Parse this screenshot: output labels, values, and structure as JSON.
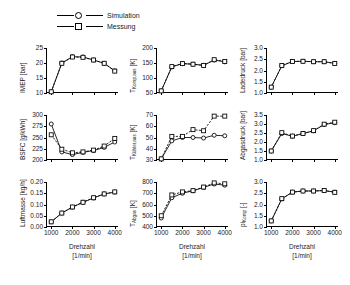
{
  "legend": {
    "entries": [
      {
        "label": "Simulation",
        "marker": "circle-marker-icon"
      },
      {
        "label": "Messung",
        "marker": "square-marker-icon"
      }
    ]
  },
  "axis": {
    "xlabel_line1": "Drehzahl",
    "xlabel_line2": "[1/min]",
    "xticks": [
      "1000",
      "2000",
      "3000",
      "4000"
    ]
  },
  "chart_data": {
    "type": "line",
    "title": "",
    "xlabel": "Drehzahl [1/min]",
    "xlim": [
      800,
      4200
    ],
    "grid": false,
    "legend_position": "top-left",
    "legend": [
      "Simulation",
      "Messung"
    ],
    "panels": [
      {
        "id": "imep",
        "ylabel": "IMEP [bar]",
        "ylabel_base": "IMEP",
        "ylabel_sub": "",
        "ylabel_unit": "[bar]",
        "ylim": [
          10,
          25
        ],
        "yticks": [
          10,
          15,
          20,
          25
        ],
        "ytick_labels": [
          "10",
          "15",
          "20",
          "25"
        ],
        "x": [
          1000,
          1500,
          2000,
          2500,
          3000,
          3500,
          4000
        ],
        "series": [
          {
            "name": "Simulation",
            "marker": "circle",
            "values": [
              10.4,
              20.0,
              22.1,
              22.0,
              21.0,
              19.9,
              17.4
            ]
          },
          {
            "name": "Messung",
            "marker": "square",
            "values": [
              10.4,
              19.9,
              22.0,
              21.9,
              21.0,
              19.9,
              17.3
            ]
          }
        ]
      },
      {
        "id": "t-komp-aus",
        "ylabel": "TKomp,aus [K]",
        "ylabel_base": "T",
        "ylabel_sub": "Komp,aus",
        "ylabel_unit": "[K]",
        "ylim": [
          50,
          200
        ],
        "yticks": [
          50,
          100,
          150,
          200
        ],
        "ytick_labels": [
          "50",
          "100",
          "150",
          "200"
        ],
        "x": [
          1000,
          1500,
          2000,
          2500,
          3000,
          3500,
          4000
        ],
        "series": [
          {
            "name": "Simulation",
            "marker": "circle",
            "values": [
              57,
              137,
              148,
              146,
              142,
              160,
              154
            ]
          },
          {
            "name": "Messung",
            "marker": "square",
            "values": [
              57,
              138,
              148,
              146,
              142,
              161,
              155
            ]
          }
        ]
      },
      {
        "id": "ladedruck",
        "ylabel": "Ladedruck [bar]",
        "ylabel_base": "Ladedruck",
        "ylabel_sub": "",
        "ylabel_unit": "[bar]",
        "ylim": [
          1.0,
          3.0
        ],
        "yticks": [
          1.0,
          1.5,
          2.0,
          2.5,
          3.0
        ],
        "ytick_labels": [
          "1.0",
          "1.5",
          "2.0",
          "2.5",
          "3.0"
        ],
        "x": [
          1000,
          1500,
          2000,
          2500,
          3000,
          3500,
          4000
        ],
        "series": [
          {
            "name": "Simulation",
            "marker": "circle",
            "values": [
              1.26,
              2.21,
              2.4,
              2.41,
              2.39,
              2.39,
              2.32
            ]
          },
          {
            "name": "Messung",
            "marker": "square",
            "values": [
              1.26,
              2.22,
              2.4,
              2.41,
              2.39,
              2.39,
              2.31
            ]
          }
        ]
      },
      {
        "id": "bsfc",
        "ylabel": "BSFC [g/kWh]",
        "ylabel_base": "BSFC",
        "ylabel_sub": "",
        "ylabel_unit": "[g/kWh]",
        "ylim": [
          200,
          300
        ],
        "yticks": [
          200,
          225,
          250,
          275,
          300
        ],
        "ytick_labels": [
          "200",
          "225",
          "250",
          "275",
          "300"
        ],
        "x": [
          1000,
          1500,
          2000,
          2500,
          3000,
          3500,
          4000
        ],
        "series": [
          {
            "name": "Simulation",
            "marker": "circle",
            "values": [
              280,
              218,
              212,
              217,
              221,
              228,
              240
            ]
          },
          {
            "name": "Messung",
            "marker": "square",
            "values": [
              256,
              224,
              216,
              218,
              222,
              231,
              248
            ]
          }
        ]
      },
      {
        "id": "t-kuehler-aus",
        "ylabel": "TKühler,aus [K]",
        "ylabel_base": "T",
        "ylabel_sub": "Kühler,aus",
        "ylabel_unit": "[K]",
        "ylim": [
          30,
          70
        ],
        "yticks": [
          30,
          40,
          50,
          60,
          70
        ],
        "ytick_labels": [
          "30",
          "40",
          "50",
          "60",
          "70"
        ],
        "x": [
          1000,
          1500,
          2000,
          2500,
          3000,
          3500,
          4000
        ],
        "series": [
          {
            "name": "Simulation",
            "marker": "circle",
            "values": [
              31,
              47,
              50,
              50,
              49.5,
              52,
              51.5
            ]
          },
          {
            "name": "Messung",
            "marker": "square",
            "values": [
              31,
              51,
              51,
              57,
              56,
              69,
              69
            ]
          }
        ]
      },
      {
        "id": "abgasdruck",
        "ylabel": "Abgasdruck [bar]",
        "ylabel_base": "Abgasdruck",
        "ylabel_sub": "",
        "ylabel_unit": "[bar]",
        "ylim": [
          1.0,
          3.5
        ],
        "yticks": [
          1.0,
          1.5,
          2.0,
          2.5,
          3.0,
          3.5
        ],
        "ytick_labels": [
          "1.0",
          "1.5",
          "2.0",
          "2.5",
          "3.0",
          "3.5"
        ],
        "x": [
          1000,
          1500,
          2000,
          2500,
          3000,
          3500,
          4000
        ],
        "series": [
          {
            "name": "Simulation",
            "marker": "circle",
            "values": [
              1.5,
              2.47,
              2.32,
              2.47,
              2.62,
              2.97,
              3.07
            ]
          },
          {
            "name": "Messung",
            "marker": "square",
            "values": [
              1.5,
              2.52,
              2.33,
              2.47,
              2.63,
              2.99,
              3.1
            ]
          }
        ]
      },
      {
        "id": "luftmasse",
        "ylabel": "Luftmasse [kg/h]",
        "ylabel_base": "Luftmasse",
        "ylabel_sub": "",
        "ylabel_unit": "[kg/h]",
        "ylim": [
          0.0,
          0.2
        ],
        "yticks": [
          0.0,
          0.05,
          0.1,
          0.15,
          0.2
        ],
        "ytick_labels": [
          "0.00",
          "0.05",
          "0.10",
          "0.15",
          "0.20"
        ],
        "x": [
          1000,
          1500,
          2000,
          2500,
          3000,
          3500,
          4000
        ],
        "series": [
          {
            "name": "Simulation",
            "marker": "circle",
            "values": [
              0.023,
              0.062,
              0.088,
              0.11,
              0.129,
              0.147,
              0.155
            ]
          },
          {
            "name": "Messung",
            "marker": "square",
            "values": [
              0.023,
              0.062,
              0.089,
              0.11,
              0.13,
              0.147,
              0.156
            ]
          }
        ]
      },
      {
        "id": "t-abgas",
        "ylabel": "TAbgas [K]",
        "ylabel_base": "T",
        "ylabel_sub": "Abgas",
        "ylabel_unit": "[K]",
        "ylim": [
          400,
          800
        ],
        "yticks": [
          400,
          500,
          600,
          700,
          800
        ],
        "ytick_labels": [
          "400",
          "500",
          "600",
          "700",
          "800"
        ],
        "x": [
          1000,
          1500,
          2000,
          2500,
          3000,
          3500,
          4000
        ],
        "series": [
          {
            "name": "Simulation",
            "marker": "circle",
            "values": [
              480,
              660,
              700,
              722,
              752,
              782,
              772
            ]
          },
          {
            "name": "Messung",
            "marker": "square",
            "values": [
              500,
              685,
              712,
              723,
              755,
              792,
              784
            ]
          }
        ]
      },
      {
        "id": "pi-komp",
        "ylabel": "piKomp [-]",
        "ylabel_base": "pi",
        "ylabel_sub": "Komp",
        "ylabel_unit": "[-]",
        "ylim": [
          1.0,
          3.0
        ],
        "yticks": [
          1.0,
          1.5,
          2.0,
          2.5,
          3.0
        ],
        "ytick_labels": [
          "1.0",
          "1.5",
          "2.0",
          "2.5",
          "3.0"
        ],
        "x": [
          1000,
          1500,
          2000,
          2500,
          3000,
          3500,
          4000
        ],
        "series": [
          {
            "name": "Simulation",
            "marker": "circle",
            "values": [
              1.27,
              2.25,
              2.55,
              2.6,
              2.6,
              2.62,
              2.55
            ]
          },
          {
            "name": "Messung",
            "marker": "square",
            "values": [
              1.27,
              2.26,
              2.55,
              2.6,
              2.6,
              2.62,
              2.54
            ]
          }
        ]
      }
    ]
  }
}
